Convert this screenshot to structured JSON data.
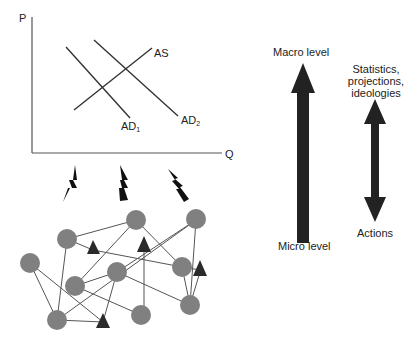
{
  "graph": {
    "y_axis_label": "P",
    "x_axis_label": "Q",
    "curves": {
      "as": {
        "label": "AS"
      },
      "ad1": {
        "label": "AD",
        "subscript": "1"
      },
      "ad2": {
        "label": "AD",
        "subscript": "2"
      }
    }
  },
  "levels": {
    "top_label": "Macro level",
    "bottom_label": "Micro level"
  },
  "feedback": {
    "top_line1": "Statistics,",
    "top_line2": "projections,",
    "top_line3": "ideologies",
    "bottom_label": "Actions"
  },
  "network": {
    "node_color": "#808080",
    "agent_color": "#2a2a2a",
    "edge_color": "#555555",
    "circle_count": 11,
    "triangle_count": 5
  },
  "colors": {
    "line": "#333333",
    "arrow": "#222222",
    "bolt": "#111111"
  }
}
